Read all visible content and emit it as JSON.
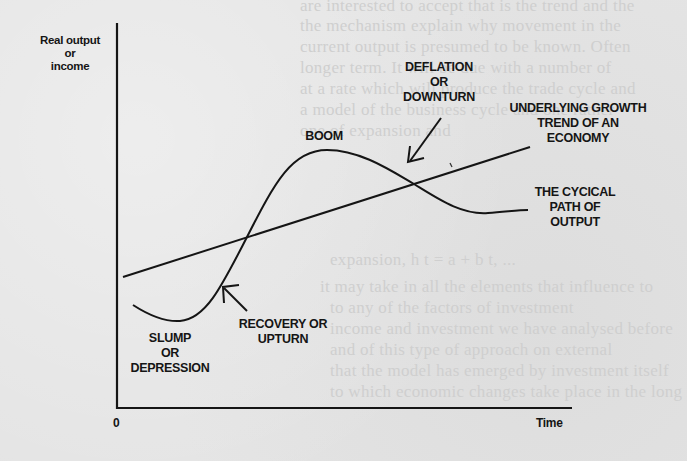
{
  "figure": {
    "y_axis_label": [
      "Real output",
      "or",
      "income"
    ],
    "x_axis_label": "Time",
    "origin_label": "0",
    "annotations": {
      "boom": [
        "BOOM"
      ],
      "deflation": [
        "DEFLATION",
        "OR",
        "DOWNTURN"
      ],
      "trend": [
        "UNDERLYING GROWTH",
        "TREND OF AN",
        "ECONOMY"
      ],
      "cyclical": [
        "THE CYCICAL",
        "PATH OF",
        "OUTPUT"
      ],
      "slump": [
        "SLUMP",
        "OR",
        "DEPRESSION"
      ],
      "recovery": [
        "RECOVERY OR",
        "UPTURN"
      ]
    },
    "colors": {
      "ink": "#151515",
      "paper": "#e4e4e4"
    }
  },
  "background_text": [
    "are interested to accept that is the trend and the",
    "the mechanism explain why movement in the",
    "current output is presumed to be known. Often",
    "longer term. It will be due with a number of",
    "at a rate which will produce the trade cycle and",
    "a model of the business cycle and one rather",
    "one of expansion and",
    "expansion, h t = a + b t, ...",
    "it may take in all the elements that influence to",
    "to any of the factors of investment",
    "income and investment we have analysed before",
    "and of this type of approach on external",
    "that the model has emerged by investment itself",
    "to which economic changes take place in the long"
  ]
}
